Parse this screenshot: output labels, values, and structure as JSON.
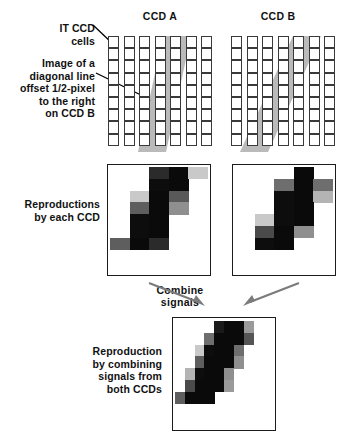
{
  "figure": {
    "title_a": "CCD A",
    "title_b": "CCD B",
    "label_cells": "IT CCD\ncells",
    "label_cells_line1": "IT CCD",
    "label_cells_line2": "cells",
    "label_diagonal": "Image of a\ndiagonal line\noffset 1/2-pixel\nto the right\non CCD B",
    "label_diagonal_l1": "Image of a",
    "label_diagonal_l2": "diagonal line",
    "label_diagonal_l3": "offset 1/2-pixel",
    "label_diagonal_l4": "to the right",
    "label_diagonal_l5": "on CCD B",
    "label_repro": "Reproductions\nby each CCD",
    "label_repro_l1": "Reproductions",
    "label_repro_l2": "by each CCD",
    "label_combine_l1": "Combine",
    "label_combine_l2": "signals",
    "label_final_l1": "Reproduction",
    "label_final_l2": "by combining",
    "label_final_l3": "signals from",
    "label_final_l4": "both CCDs"
  },
  "colors": {
    "cell_stroke": "#3a3a3a",
    "cell_fill": "#ffffff",
    "band_fill": "#8f8f8f",
    "band_overlap": "#6e6e6e",
    "box_stroke": "#1c1c1c",
    "arrow_black": "#000000",
    "arrow_gray": "#7b7b7b",
    "text": "#111111"
  },
  "chart_data": {
    "type": "diagram",
    "ccd_a": {
      "columns": 7,
      "rows": 9,
      "cell_w": 11,
      "cell_h": 12.2,
      "col_gap": 4.5,
      "band_top_left_col": 3.55,
      "band_top_right_col": 5.35,
      "band_bottom_left_col": 1.95,
      "band_bottom_right_col": 3.75
    },
    "ccd_b": {
      "columns": 7,
      "rows": 9,
      "cell_w": 11,
      "cell_h": 12.2,
      "col_gap": 4.5,
      "band_top_left_col": 4.05,
      "band_top_right_col": 5.85,
      "band_bottom_left_col": 2.45,
      "band_bottom_right_col": 4.25
    },
    "repro_a": {
      "cols": 5,
      "rows": 9,
      "note": "grayscale sampled line, full-pixel columns",
      "grid": [
        [
          null,
          null,
          "#2b2b2b",
          "#0a0a0a",
          "#c9c9c9"
        ],
        [
          null,
          null,
          "#0d0d0d",
          "#0a0a0a",
          null
        ],
        [
          null,
          "#c9c9c9",
          "#0a0a0a",
          "#595959",
          null
        ],
        [
          null,
          "#5e5e5e",
          "#0a0a0a",
          "#8f8f8f",
          null
        ],
        [
          null,
          "#0d0d0d",
          "#0a0a0a",
          null,
          null
        ],
        [
          null,
          "#0d0d0d",
          "#0a0a0a",
          null,
          null
        ],
        [
          "#5e5e5e",
          "#0a0a0a",
          "#2b2b2b",
          null,
          null
        ],
        [
          null,
          null,
          null,
          null,
          null
        ],
        [
          null,
          null,
          null,
          null,
          null
        ]
      ]
    },
    "repro_b": {
      "cols": 5,
      "rows": 9,
      "note": "grayscale sampled line shifted half pixel right",
      "grid": [
        [
          null,
          null,
          null,
          "#0a0a0a",
          null
        ],
        [
          null,
          null,
          "#6e6e6e",
          "#0a0a0a",
          "#6e6e6e"
        ],
        [
          null,
          null,
          "#0d0d0d",
          "#0a0a0a",
          "#b4b4b4"
        ],
        [
          null,
          null,
          "#0d0d0d",
          "#0a0a0a",
          null
        ],
        [
          null,
          "#c9c9c9",
          "#0d0d0d",
          "#0a0a0a",
          null
        ],
        [
          null,
          "#4a4a4a",
          "#0a0a0a",
          "#8f8f8f",
          null
        ],
        [
          null,
          "#0d0d0d",
          "#0a0a0a",
          null,
          null
        ],
        [
          null,
          null,
          null,
          null,
          null
        ],
        [
          null,
          null,
          null,
          null,
          null
        ]
      ]
    },
    "repro_combined": {
      "cols": 10,
      "rows": 9,
      "note": "combined signals at half-pixel sampling pitch",
      "grid": [
        [
          null,
          null,
          null,
          null,
          "#1a1a1a",
          "#0a0a0a",
          "#0a0a0a",
          "#9a9a9a",
          null,
          null
        ],
        [
          null,
          null,
          null,
          "#6e6e6e",
          "#0a0a0a",
          "#0a0a0a",
          "#0a0a0a",
          "#555555",
          null,
          null
        ],
        [
          null,
          null,
          "#c9c9c9",
          "#0d0d0d",
          "#0a0a0a",
          "#0a0a0a",
          "#6e6e6e",
          null,
          null,
          null
        ],
        [
          null,
          null,
          "#5e5e5e",
          "#0a0a0a",
          "#0a0a0a",
          "#0a0a0a",
          "#8f8f8f",
          null,
          null,
          null
        ],
        [
          null,
          "#b4b4b4",
          "#0d0d0d",
          "#0a0a0a",
          "#0a0a0a",
          "#8f8f8f",
          null,
          null,
          null,
          null
        ],
        [
          null,
          "#4a4a4a",
          "#0a0a0a",
          "#0a0a0a",
          "#0a0a0a",
          "#9a9a9a",
          null,
          null,
          null,
          null
        ],
        [
          "#5e5e5e",
          "#0a0a0a",
          "#0a0a0a",
          "#0a0a0a",
          null,
          null,
          null,
          null,
          null,
          null
        ],
        [
          null,
          null,
          null,
          null,
          null,
          null,
          null,
          null,
          null,
          null
        ],
        [
          null,
          null,
          null,
          null,
          null,
          null,
          null,
          null,
          null,
          null
        ]
      ]
    }
  }
}
